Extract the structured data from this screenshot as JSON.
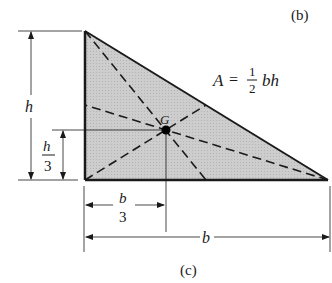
{
  "figure": {
    "panel_label_top": "(b)",
    "caption": "(c)",
    "area_formula": {
      "lhs": "A",
      "eq": "=",
      "numerator": "1",
      "denominator": "2",
      "rhs": "bh"
    },
    "centroid_label": "G",
    "height_label": "h",
    "height_third": {
      "numerator": "h",
      "denominator": "3"
    },
    "base_label": "b",
    "base_third": {
      "numerator": "b",
      "denominator": "3"
    }
  },
  "geometry": {
    "vertices": {
      "top": [
        85,
        31
      ],
      "bottom_left": [
        85,
        180
      ],
      "bottom_right": [
        328,
        180
      ]
    },
    "centroid": [
      166,
      130
    ],
    "fill_color": "#c8c8c8",
    "stroke_color": "#1a1a1a"
  }
}
